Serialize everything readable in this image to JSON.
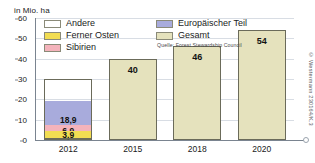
{
  "axis_unit_label": "in Mio. ha",
  "legend": {
    "column_1": [
      {
        "label": "Andere",
        "color": "#ffffff"
      },
      {
        "label": "Ferner Osten",
        "color": "#f2dd52"
      },
      {
        "label": "Sibirien",
        "color": "#f4b3bb"
      }
    ],
    "column_2": [
      {
        "label": "Europäischer Teil",
        "color": "#a8abdc"
      },
      {
        "label": "Gesamt",
        "color": "#e5e2bd"
      }
    ],
    "source": "Quelle: Forest Stewardship Council"
  },
  "copyright": "© Westermann 230164/K.3",
  "chart_data": {
    "type": "bar",
    "title": "",
    "subtitle": "",
    "xlabel": "",
    "ylabel": "in Mio. ha",
    "ylim": [
      0,
      60
    ],
    "yticks": [
      0,
      10,
      20,
      30,
      40,
      50,
      60
    ],
    "ytick_labels": [
      "0",
      "10",
      "20",
      "30",
      "40",
      "50",
      "60"
    ],
    "grid": true,
    "legend_position": "top-inside",
    "categories": [
      "2012",
      "2015",
      "2018",
      "2020"
    ],
    "stacked_category": "2012",
    "series": [
      {
        "name": "Europäischer Teil",
        "color": "#a8abdc",
        "values": [
          18.9,
          null,
          null,
          null
        ],
        "labels": [
          "18,9",
          "",
          "",
          ""
        ]
      },
      {
        "name": "Sibirien",
        "color": "#f4b3bb",
        "values": [
          6.9,
          null,
          null,
          null
        ],
        "labels": [
          "6,9",
          "",
          "",
          ""
        ]
      },
      {
        "name": "Ferner Osten",
        "color": "#f2dd52",
        "values": [
          3.9,
          null,
          null,
          null
        ],
        "labels": [
          "3,9",
          "",
          "",
          ""
        ]
      },
      {
        "name": "Andere",
        "color": "#ffffff",
        "values": [
          0.3,
          null,
          null,
          null
        ],
        "labels": [
          "0,3",
          "",
          "",
          ""
        ]
      },
      {
        "name": "Gesamt",
        "color": "#e5e2bd",
        "values": [
          null,
          40,
          46,
          54
        ],
        "labels": [
          "",
          "40",
          "46",
          "54"
        ]
      }
    ],
    "bars": [
      {
        "category": "2012",
        "type": "stacked",
        "total": 30,
        "segments": [
          {
            "name": "Europäischer Teil",
            "value": 18.9,
            "label": "18,9",
            "color": "#a8abdc"
          },
          {
            "name": "Sibirien",
            "value": 6.9,
            "label": "6,9",
            "color": "#f4b3bb"
          },
          {
            "name": "Ferner Osten",
            "value": 3.9,
            "label": "3,9",
            "color": "#f2dd52"
          },
          {
            "name": "Andere",
            "value": 0.3,
            "label": "0,3",
            "color": "#ffffff"
          }
        ]
      },
      {
        "category": "2015",
        "type": "total",
        "name": "Gesamt",
        "value": 40,
        "label": "40",
        "color": "#e5e2bd"
      },
      {
        "category": "2018",
        "type": "total",
        "name": "Gesamt",
        "value": 46,
        "label": "46",
        "color": "#e5e2bd"
      },
      {
        "category": "2020",
        "type": "total",
        "name": "Gesamt",
        "value": 54,
        "label": "54",
        "color": "#e5e2bd"
      }
    ]
  }
}
